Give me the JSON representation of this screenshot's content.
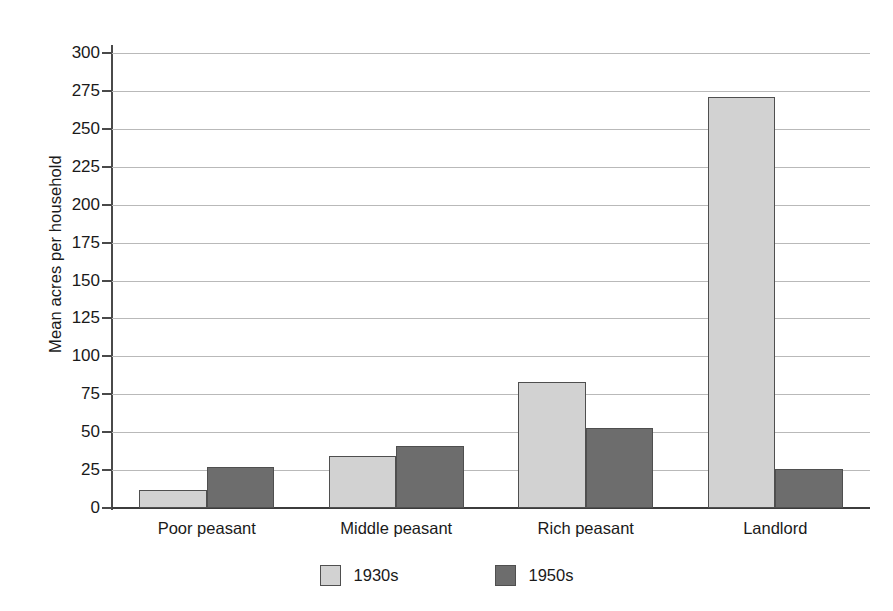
{
  "chart_data": {
    "type": "bar",
    "title": "",
    "subtitle": "",
    "xlabel": "",
    "ylabel": "Mean acres per household",
    "categories": [
      "Poor peasant",
      "Middle peasant",
      "Rich peasant",
      "Landlord"
    ],
    "series": [
      {
        "name": "1930s",
        "color": "#d2d2d2",
        "values": [
          12,
          34,
          83,
          271
        ]
      },
      {
        "name": "1950s",
        "color": "#6d6d6d",
        "values": [
          27,
          41,
          53,
          26
        ]
      }
    ],
    "ylim": [
      0,
      300
    ],
    "ytick_step": 25,
    "ytick_labels": [
      "300",
      "275",
      "250",
      "225",
      "200",
      "175",
      "150",
      "125",
      "100",
      "75",
      "50",
      "25",
      "0"
    ],
    "ytick_values": [
      300,
      275,
      250,
      225,
      200,
      175,
      150,
      125,
      100,
      75,
      50,
      25,
      0
    ],
    "grid": true,
    "grid_axis": "y",
    "legend_position": "bottom-center",
    "legend_entries": [
      "1930s",
      "1950s"
    ],
    "annotations": [],
    "background_color": "#ffffff",
    "axis_color": "#4a4a4a",
    "gridline_color": "#b9b9b9"
  }
}
